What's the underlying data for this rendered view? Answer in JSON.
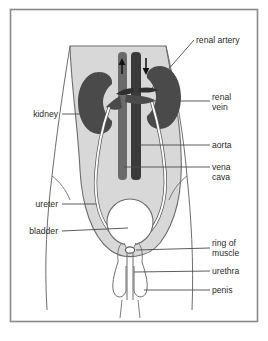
{
  "figure": {
    "frame": {
      "border_color": "#8a8a8a",
      "background": "#ffffff"
    }
  },
  "colors": {
    "body_fill": "#d8d8d8",
    "body_outline": "#6d6d6d",
    "kidney_fill": "#4a4a4a",
    "vessel_dark": "#3a3a3a",
    "vessel_mid": "#6b6b6b",
    "ureter_stroke": "#5a5a5a",
    "ureter_fill": "#ffffff",
    "bladder_fill": "#ffffff",
    "label_text": "#2b2b2b",
    "leader_line": "#4a4a4a",
    "arrow": "#111111"
  },
  "labels": {
    "renal_artery": "renal artery",
    "renal_vein_line1": "renal",
    "renal_vein_line2": "vein",
    "aorta": "aorta",
    "vena_cava_line1": "vena",
    "vena_cava_line2": "cava",
    "ring_of_muscle_line1": "ring of",
    "ring_of_muscle_line2": "muscle",
    "urethra": "urethra",
    "penis": "penis",
    "kidney": "kidney",
    "ureter": "ureter",
    "bladder": "bladder"
  },
  "structures": [
    {
      "name": "renal artery",
      "side": "right",
      "label_x": 196,
      "label_y": 43
    },
    {
      "name": "renal vein",
      "side": "right",
      "label_x": 212,
      "label_y": 100
    },
    {
      "name": "aorta",
      "side": "right",
      "label_x": 212,
      "label_y": 145
    },
    {
      "name": "vena cava",
      "side": "right",
      "label_x": 212,
      "label_y": 166
    },
    {
      "name": "ring of muscle",
      "side": "right",
      "label_x": 212,
      "label_y": 245
    },
    {
      "name": "urethra",
      "side": "right",
      "label_x": 212,
      "label_y": 272
    },
    {
      "name": "penis",
      "side": "right",
      "label_x": 212,
      "label_y": 291
    },
    {
      "name": "kidney",
      "side": "left",
      "label_x": 58,
      "label_y": 116
    },
    {
      "name": "ureter",
      "side": "left",
      "label_x": 58,
      "label_y": 206
    },
    {
      "name": "bladder",
      "side": "left",
      "label_x": 58,
      "label_y": 234
    }
  ],
  "flow_arrows": [
    {
      "name": "vena-cava-upward-flow",
      "direction": "up",
      "x": 122,
      "y": 68
    },
    {
      "name": "aorta-downward-flow",
      "direction": "down",
      "x": 146,
      "y": 68
    }
  ]
}
